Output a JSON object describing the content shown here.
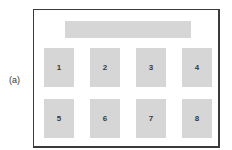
{
  "figure_label": "(a)",
  "layout": {
    "header_bar": {
      "text": ""
    },
    "boxes": [
      {
        "label": "1",
        "row": 1,
        "col": 1
      },
      {
        "label": "2",
        "row": 1,
        "col": 2
      },
      {
        "label": "3",
        "row": 1,
        "col": 3
      },
      {
        "label": "4",
        "row": 1,
        "col": 4
      },
      {
        "label": "5",
        "row": 2,
        "col": 1
      },
      {
        "label": "6",
        "row": 2,
        "col": 2
      },
      {
        "label": "7",
        "row": 2,
        "col": 3
      },
      {
        "label": "8",
        "row": 2,
        "col": 4
      }
    ]
  },
  "colors": {
    "frame_border": "#3a3a3a",
    "box_fill": "#d6d6d6",
    "text": "#3a3a3a"
  }
}
